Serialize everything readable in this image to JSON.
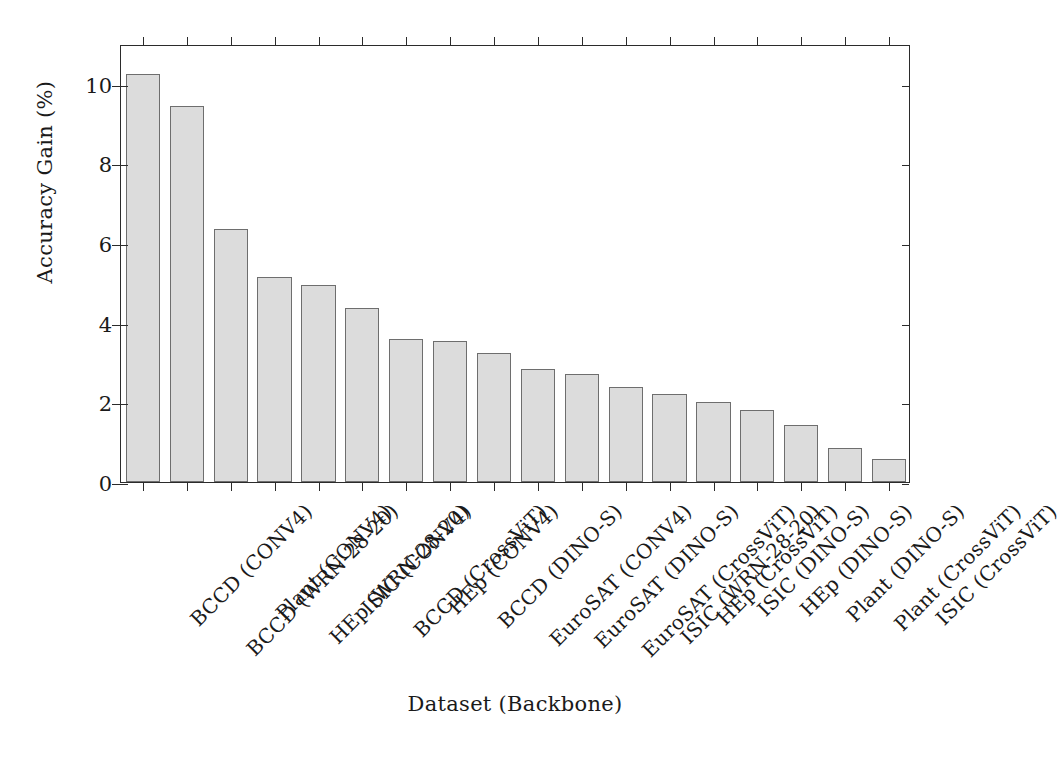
{
  "chart_data": {
    "type": "bar",
    "title": "",
    "xlabel": "Dataset (Backbone)",
    "ylabel": "Accuracy Gain (%)",
    "ylim": [
      0,
      11
    ],
    "yticks": [
      0,
      2,
      4,
      6,
      8,
      10
    ],
    "ytick_labels": [
      "0",
      "2",
      "4",
      "6",
      "8",
      "10"
    ],
    "grid": false,
    "legend": null,
    "bar_fill_color": "#dcdcdc",
    "bar_edge_color": "#6e6e6e",
    "axis_color": "#2b2b2b",
    "categories": [
      "BCCD (CONV4)",
      "BCCD (WRN-28-20)",
      "Plant (CONV4)",
      "HEp (WRN-28-20)",
      "ISIC (CONV4)",
      "BCCD (CrossViT)",
      "HEp (CONV4)",
      "BCCD (DINO-S)",
      "EuroSAT (CONV4)",
      "EuroSAT (DINO-S)",
      "EuroSAT (CrossViT)",
      "ISIC (WRN-28-20)",
      "HEp (CrossViT)",
      "ISIC (DINO-S)",
      "HEp (DINO-S)",
      "Plant (DINO-S)",
      "Plant (CrossViT)",
      "ISIC (CrossViT)"
    ],
    "values": [
      10.25,
      9.45,
      6.35,
      5.15,
      4.95,
      4.38,
      3.6,
      3.55,
      3.25,
      2.85,
      2.72,
      2.38,
      2.22,
      2.0,
      1.8,
      1.42,
      0.85,
      0.58
    ]
  }
}
